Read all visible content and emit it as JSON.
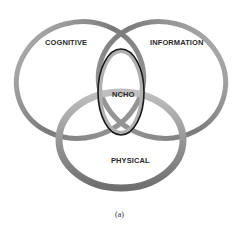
{
  "diagram": {
    "nodes": [
      {
        "id": "cognitive",
        "label": "COGNITIVE"
      },
      {
        "id": "information",
        "label": "INFORMATION"
      },
      {
        "id": "physical",
        "label": "PHYSICAL"
      },
      {
        "id": "ncho",
        "label": "NCHO"
      }
    ],
    "caption": "(a)",
    "colors": {
      "ribbon": "#8a8a8a",
      "ncho_outline": "#1a1a1a",
      "text": "#2a2a2a"
    }
  }
}
